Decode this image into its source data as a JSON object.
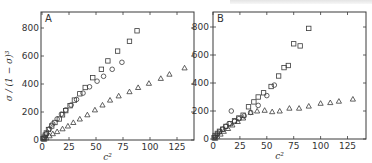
{
  "chart_data": [
    {
      "type": "scatter",
      "panel": "A",
      "xlabel": "c²",
      "ylabel": "σ/(1−σ)³",
      "xlim": [
        0,
        140
      ],
      "ylim": [
        0,
        900
      ],
      "xticks": [
        0,
        25,
        50,
        75,
        100,
        125
      ],
      "yticks": [
        0,
        200,
        400,
        600,
        800
      ],
      "grid": false,
      "series": [
        {
          "name": "squares",
          "marker": "square",
          "x": [
            1,
            2,
            3,
            4,
            6,
            9,
            12,
            16,
            19,
            22,
            26,
            30,
            35,
            40,
            47,
            55,
            61,
            70,
            81,
            88
          ],
          "y": [
            10,
            20,
            35,
            50,
            75,
            100,
            125,
            150,
            180,
            210,
            245,
            285,
            330,
            375,
            445,
            505,
            565,
            635,
            705,
            780
          ]
        },
        {
          "name": "circles",
          "marker": "circle",
          "x": [
            2,
            4,
            7,
            10,
            14,
            18,
            22,
            27,
            32,
            38,
            44,
            51,
            57,
            65,
            74
          ],
          "y": [
            15,
            45,
            80,
            115,
            150,
            185,
            215,
            250,
            290,
            335,
            380,
            420,
            455,
            505,
            555
          ]
        },
        {
          "name": "triangles",
          "marker": "triangle",
          "x": [
            2,
            4,
            7,
            10,
            14,
            19,
            24,
            29,
            35,
            42,
            49,
            56,
            63,
            71,
            81,
            89,
            99,
            110,
            118,
            132
          ],
          "y": [
            5,
            15,
            30,
            45,
            60,
            80,
            100,
            125,
            150,
            180,
            215,
            250,
            285,
            315,
            345,
            375,
            405,
            440,
            470,
            515
          ]
        }
      ]
    },
    {
      "type": "scatter",
      "panel": "B",
      "xlabel": "c²",
      "ylabel": "",
      "xlim": [
        0,
        142
      ],
      "ylim": [
        0,
        900
      ],
      "xticks": [
        0,
        25,
        50,
        75,
        100,
        125
      ],
      "yticks": [
        0,
        200,
        400,
        600,
        800
      ],
      "grid": false,
      "series": [
        {
          "name": "squares",
          "marker": "square",
          "x": [
            1,
            2,
            4,
            6,
            9,
            12,
            16,
            20,
            24,
            28,
            33,
            38,
            42,
            47,
            54,
            61,
            66,
            70,
            75,
            81,
            89
          ],
          "y": [
            10,
            25,
            40,
            55,
            70,
            90,
            110,
            130,
            150,
            170,
            230,
            265,
            300,
            330,
            375,
            450,
            510,
            525,
            680,
            665,
            790
          ]
        },
        {
          "name": "circles",
          "marker": "circle",
          "x": [
            2,
            4,
            6,
            9,
            12,
            15,
            17,
            20,
            24,
            29,
            35,
            42,
            50,
            57
          ],
          "y": [
            15,
            35,
            50,
            70,
            90,
            110,
            200,
            125,
            145,
            165,
            190,
            240,
            310,
            385
          ]
        },
        {
          "name": "triangles",
          "marker": "triangle",
          "x": [
            2,
            4,
            7,
            10,
            14,
            18,
            23,
            28,
            35,
            41,
            48,
            55,
            62,
            71,
            80,
            89,
            100,
            109,
            117,
            130
          ],
          "y": [
            5,
            20,
            35,
            55,
            75,
            100,
            125,
            150,
            190,
            200,
            205,
            195,
            200,
            220,
            220,
            235,
            255,
            260,
            270,
            285
          ]
        }
      ]
    }
  ],
  "panels": {
    "A": {
      "letter": "A",
      "xlabel": "c²",
      "ylabel": "σ / (1 − σ)³"
    },
    "B": {
      "letter": "B",
      "xlabel": "c²"
    }
  },
  "axis": {
    "xticks": [
      "0",
      "25",
      "50",
      "75",
      "100",
      "125"
    ],
    "yticks": [
      "0",
      "200",
      "400",
      "600",
      "800"
    ]
  },
  "colors": {
    "ink": "#3a3a3a",
    "background": "#ffffff"
  }
}
